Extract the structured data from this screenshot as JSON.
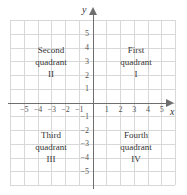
{
  "figure": {
    "type": "cartesian-coordinate-plane",
    "axis_labels": {
      "x": "x",
      "y": "y"
    },
    "colors": {
      "grid": "#d8d8d8",
      "axis": "#6e6e6e",
      "text": "#333333",
      "tick_text": "#555555",
      "background": "#ffffff"
    }
  },
  "ticks": {
    "x_negative": [
      "−5",
      "−4",
      "−3",
      "−2",
      "−1"
    ],
    "x_positive": [
      "1",
      "2",
      "3",
      "4",
      "5"
    ],
    "y_positive": [
      "5",
      "4",
      "3",
      "2",
      "1"
    ],
    "y_negative": [
      "−1",
      "−2",
      "−3",
      "−4",
      "−5"
    ]
  },
  "quadrants": [
    {
      "id": "q1",
      "line1": "First",
      "line2": "quadrant",
      "numeral": "I"
    },
    {
      "id": "q2",
      "line1": "Second",
      "line2": "quadrant",
      "numeral": "II"
    },
    {
      "id": "q3",
      "line1": "Third",
      "line2": "quadrant",
      "numeral": "III"
    },
    {
      "id": "q4",
      "line1": "Fourth",
      "line2": "quadrant",
      "numeral": "IV"
    }
  ],
  "chart_data": {
    "type": "scatter",
    "title": "",
    "xlabel": "x",
    "ylabel": "y",
    "xlim": [
      -6,
      6
    ],
    "ylim": [
      -6,
      6
    ],
    "xticks": [
      -5,
      -4,
      -3,
      -2,
      -1,
      1,
      2,
      3,
      4,
      5
    ],
    "yticks": [
      -5,
      -4,
      -3,
      -2,
      -1,
      1,
      2,
      3,
      4,
      5
    ],
    "grid": true,
    "grid_columns": 12,
    "grid_rows": 12,
    "legend": null,
    "series": [],
    "annotations": [
      {
        "text": "Second quadrant II",
        "quadrant": 2,
        "x": -3,
        "y": 3
      },
      {
        "text": "First quadrant I",
        "quadrant": 1,
        "x": 3,
        "y": 3
      },
      {
        "text": "Third quadrant III",
        "quadrant": 3,
        "x": -3,
        "y": -3
      },
      {
        "text": "Fourth quadrant IV",
        "quadrant": 4,
        "x": 3,
        "y": -3
      }
    ]
  }
}
